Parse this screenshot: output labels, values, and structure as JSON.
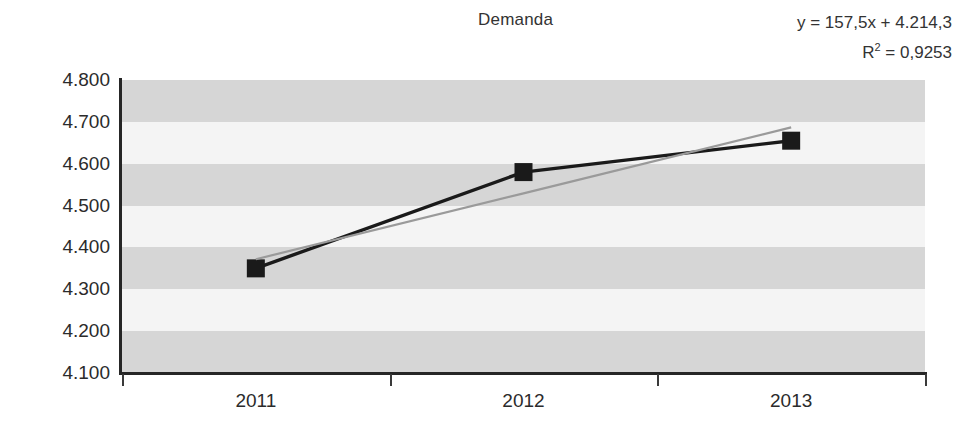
{
  "chart_data": {
    "type": "line",
    "title": "Demanda",
    "xlabel": "",
    "ylabel": "",
    "categories": [
      "2011",
      "2012",
      "2013"
    ],
    "series": [
      {
        "name": "Demanda",
        "values": [
          4350,
          4580,
          4655
        ],
        "marker": "square",
        "color": "#1a1a1a"
      },
      {
        "name": "Linear (Demanda)",
        "values": [
          4371.8,
          4529.3,
          4686.8
        ],
        "marker": "none",
        "color": "#9a9a9a",
        "trendline": true
      }
    ],
    "ylim": [
      4100,
      4800
    ],
    "ytick_values": [
      4800,
      4700,
      4600,
      4500,
      4400,
      4300,
      4200,
      4100
    ],
    "ytick_labels": [
      "4.800",
      "4.700",
      "4.600",
      "4.500",
      "4.400",
      "4.300",
      "4.200",
      "4.100"
    ],
    "grid": "horizontal-bands",
    "legend": "none",
    "annotations": {
      "equation": "y = 157,5x + 4.214,3",
      "r_squared_prefix": "R",
      "r_squared_exponent": "2",
      "r_squared_value": " = 0,9253"
    }
  },
  "colors": {
    "series_line": "#1a1a1a",
    "trendline": "#9a9a9a",
    "band_dark": "#d6d6d6",
    "band_light": "#f4f4f4",
    "axis": "#262626",
    "text": "#2b2b2b"
  }
}
